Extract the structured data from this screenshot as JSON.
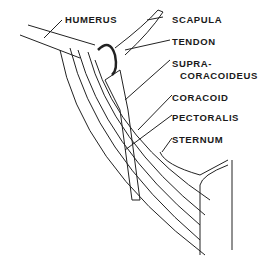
{
  "diagram": {
    "type": "anatomical-line-drawing",
    "labels": [
      {
        "id": "humerus",
        "text": "HUMERUS"
      },
      {
        "id": "scapula",
        "text": "SCAPULA"
      },
      {
        "id": "tendon",
        "text": "TENDON"
      },
      {
        "id": "supracoracoideus_1",
        "text": "SUPRA-"
      },
      {
        "id": "supracoracoideus_2",
        "text": "CORACOIDEUS"
      },
      {
        "id": "coracoid",
        "text": "CORACOID"
      },
      {
        "id": "pectoralis",
        "text": "PECTORALIS"
      },
      {
        "id": "sternum",
        "text": "STERNUM"
      }
    ],
    "colors": {
      "ink": "#1a1a1a",
      "background": "#ffffff"
    }
  }
}
